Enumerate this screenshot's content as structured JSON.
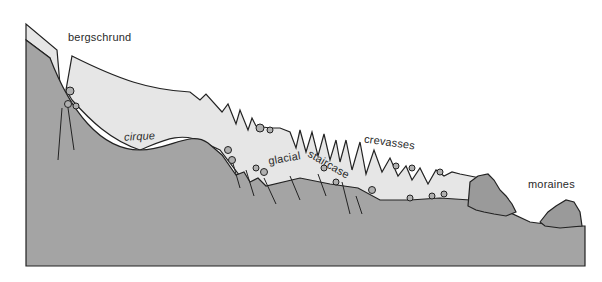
{
  "diagram": {
    "colors": {
      "bedrock": "#a4a4a4",
      "ice": "#e6e6e6",
      "moraine": "#9a9a9a",
      "outline": "#222222",
      "background": "#ffffff"
    },
    "labels": {
      "bergschrund": "bergschrund",
      "cirque": "cirque",
      "glacial": "glacial",
      "staircase": "staircase",
      "crevasses": "crevasses",
      "moraines": "moraines"
    }
  }
}
